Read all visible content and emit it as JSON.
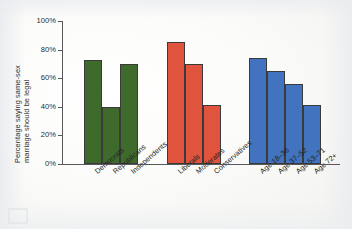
{
  "chart_data": {
    "type": "bar",
    "title": "",
    "xlabel": "",
    "ylabel": "Percentage saying same-sex marriage should be legal",
    "ylabel_line1": "Percentage saying same-sex",
    "ylabel_line2": "marriage should be legal",
    "ylim": [
      0,
      100
    ],
    "yticks": [
      "0%",
      "20%",
      "40%",
      "60%",
      "80%",
      "100%"
    ],
    "ytick_values": [
      0,
      20,
      40,
      60,
      80,
      100
    ],
    "grid": false,
    "legend": "none",
    "categories": [
      "Democrats",
      "Republicans",
      "Independents",
      "Liberals",
      "Moderates",
      "Conservatives",
      "Age 18–36",
      "Age 37–52",
      "Age 53–71",
      "Age 72+"
    ],
    "values": [
      73,
      40,
      70,
      85,
      70,
      41,
      74,
      65,
      56,
      41
    ],
    "groups": [
      {
        "name": "Party identification",
        "color": "#3E6B2B",
        "categories": [
          "Democrats",
          "Republicans",
          "Independents"
        ],
        "values": [
          73,
          40,
          70
        ]
      },
      {
        "name": "Political ideology",
        "color": "#E0533C",
        "categories": [
          "Liberals",
          "Moderates",
          "Conservatives"
        ],
        "values": [
          85,
          70,
          41
        ]
      },
      {
        "name": "Age group",
        "color": "#4273BF",
        "categories": [
          "Age 18–36",
          "Age 37–52",
          "Age 53–71",
          "Age 72+"
        ],
        "values": [
          74,
          65,
          56,
          41
        ]
      }
    ]
  },
  "colors": {
    "green": "#3E6B2B",
    "red": "#E0533C",
    "blue": "#4273BF",
    "axis": "#58585a",
    "text": "#2b2b2b",
    "background": "#f7f7f5"
  }
}
